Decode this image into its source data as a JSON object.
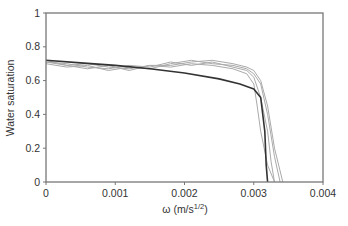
{
  "chart_data": {
    "type": "line",
    "title": "",
    "xlabel": "ω (m/s^1/2)",
    "xlabel_main": "ω (m/s",
    "xlabel_sup": "1/2",
    "xlabel_close": ")",
    "ylabel": "Water saturation",
    "xlim": [
      0,
      0.004
    ],
    "ylim": [
      0,
      1
    ],
    "x_ticks": [
      "0",
      "0.001",
      "0.002",
      "0.003",
      "0.004"
    ],
    "y_ticks": [
      "0",
      "0.2",
      "0.4",
      "0.6",
      "0.8",
      "1"
    ],
    "grid": false,
    "legend": null,
    "series": [
      {
        "name": "Model (dark)",
        "color": "#333333",
        "x": [
          0,
          0.0005,
          0.001,
          0.0015,
          0.002,
          0.0025,
          0.0028,
          0.003,
          0.0031,
          0.00316,
          0.00318,
          0.0032
        ],
        "y": [
          0.72,
          0.705,
          0.69,
          0.67,
          0.645,
          0.61,
          0.58,
          0.55,
          0.5,
          0.3,
          0.1,
          0.0
        ]
      },
      {
        "name": "Measured 1 (gray)",
        "color": "#aaaaaa",
        "x": [
          0,
          0.0003,
          0.0006,
          0.0009,
          0.0012,
          0.0015,
          0.0018,
          0.0021,
          0.0024,
          0.0027,
          0.0029,
          0.003,
          0.00305,
          0.0031,
          0.0032,
          0.0033
        ],
        "y": [
          0.72,
          0.69,
          0.67,
          0.69,
          0.66,
          0.69,
          0.68,
          0.7,
          0.69,
          0.67,
          0.64,
          0.58,
          0.45,
          0.3,
          0.1,
          0.0
        ]
      },
      {
        "name": "Measured 2 (gray)",
        "color": "#aaaaaa",
        "x": [
          0,
          0.0003,
          0.0006,
          0.0009,
          0.0012,
          0.0015,
          0.0018,
          0.0021,
          0.0024,
          0.0027,
          0.0029,
          0.003,
          0.0031,
          0.0032,
          0.00325,
          0.0033
        ],
        "y": [
          0.71,
          0.7,
          0.68,
          0.67,
          0.69,
          0.68,
          0.71,
          0.69,
          0.71,
          0.68,
          0.66,
          0.62,
          0.5,
          0.3,
          0.12,
          0.0
        ]
      },
      {
        "name": "Measured 3 (gray)",
        "color": "#aaaaaa",
        "x": [
          0,
          0.0003,
          0.0006,
          0.0009,
          0.0012,
          0.0015,
          0.0018,
          0.0021,
          0.0024,
          0.0027,
          0.0029,
          0.003,
          0.0031,
          0.0032,
          0.0033,
          0.00338
        ],
        "y": [
          0.7,
          0.68,
          0.69,
          0.66,
          0.68,
          0.67,
          0.7,
          0.72,
          0.7,
          0.69,
          0.67,
          0.64,
          0.58,
          0.4,
          0.15,
          0.0
        ]
      },
      {
        "name": "Measured 4 (gray)",
        "color": "#aaaaaa",
        "x": [
          0,
          0.0003,
          0.0006,
          0.0009,
          0.0012,
          0.0015,
          0.0018,
          0.0021,
          0.0024,
          0.0027,
          0.0029,
          0.003,
          0.0031,
          0.0032,
          0.0033,
          0.00342
        ],
        "y": [
          0.71,
          0.69,
          0.7,
          0.68,
          0.67,
          0.69,
          0.69,
          0.71,
          0.72,
          0.7,
          0.68,
          0.66,
          0.6,
          0.45,
          0.2,
          0.0
        ]
      }
    ]
  }
}
